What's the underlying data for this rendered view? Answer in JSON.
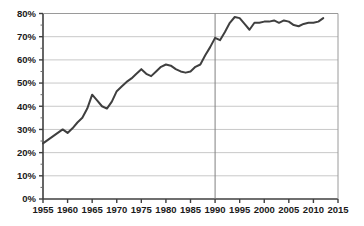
{
  "chart_data": {
    "type": "line",
    "title": "",
    "subtitle": "",
    "xlabel": "",
    "ylabel": "",
    "xlim": [
      1955,
      2015
    ],
    "ylim": [
      0,
      80
    ],
    "grid": true,
    "grid_axis": "y",
    "legend": false,
    "legend_position": "none",
    "y_tick_labels": [
      "0%",
      "10%",
      "20%",
      "30%",
      "40%",
      "50%",
      "60%",
      "70%",
      "80%"
    ],
    "y_ticks": [
      0,
      10,
      20,
      30,
      40,
      50,
      60,
      70,
      80
    ],
    "x_tick_labels": [
      "1955",
      "1960",
      "1965",
      "1970",
      "1975",
      "1980",
      "1985",
      "1990",
      "1995",
      "2000",
      "2005",
      "2010",
      "2015"
    ],
    "x_ticks": [
      1955,
      1960,
      1965,
      1970,
      1975,
      1980,
      1985,
      1990,
      1995,
      2000,
      2005,
      2010,
      2015
    ],
    "y_tick_suffix": "%",
    "annotations": [
      {
        "type": "vertical-line",
        "x": 1990,
        "label": "",
        "color": "#808080"
      }
    ],
    "series": [
      {
        "name": "",
        "color": "#3f3f3f",
        "line_width": 2,
        "x": [
          1955,
          1956,
          1957,
          1958,
          1959,
          1960,
          1961,
          1962,
          1963,
          1964,
          1965,
          1966,
          1967,
          1968,
          1969,
          1970,
          1971,
          1972,
          1973,
          1974,
          1975,
          1976,
          1977,
          1978,
          1979,
          1980,
          1981,
          1982,
          1983,
          1984,
          1985,
          1986,
          1987,
          1988,
          1989,
          1990,
          1991,
          1992,
          1993,
          1994,
          1995,
          1996,
          1997,
          1998,
          1999,
          2000,
          2001,
          2002,
          2003,
          2004,
          2005,
          2006,
          2007,
          2008,
          2009,
          2010,
          2011,
          2012
        ],
        "values": [
          24,
          25.5,
          27,
          28.5,
          30,
          28.5,
          30.5,
          33,
          35,
          39,
          45,
          42.5,
          40,
          39,
          42,
          46.5,
          48.5,
          50.5,
          52,
          54,
          56,
          54,
          53,
          55,
          57,
          58,
          57.5,
          56,
          55,
          54.5,
          55,
          57,
          58,
          62,
          65.5,
          69.5,
          68.5,
          72,
          76,
          78.5,
          78,
          75.5,
          73,
          76,
          76,
          76.5,
          76.5,
          77,
          76,
          77,
          76.5,
          75,
          74.5,
          75.5,
          76,
          76,
          76.5,
          78
        ]
      }
    ]
  },
  "axes": {
    "frame_color": "#3f3f3f",
    "grid_color": "#c8c8c8",
    "background": "#ffffff"
  }
}
